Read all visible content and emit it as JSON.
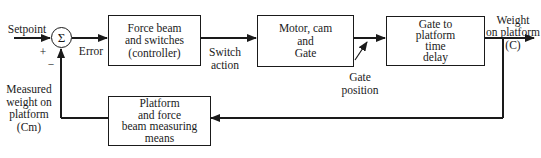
{
  "diagram": {
    "type": "block-diagram",
    "input": {
      "label": "Setpoint",
      "sign_plus": "+",
      "sign_minus": "−"
    },
    "summing_junction": {
      "symbol": "Σ"
    },
    "error_label": "Error",
    "blocks": [
      {
        "id": "controller",
        "label": "Force beam\nand switches\n(controller)"
      },
      {
        "id": "actuator",
        "label": "Motor, cam\nand\nGate"
      },
      {
        "id": "process",
        "label": "Gate to\nplatform\ntime\ndelay"
      },
      {
        "id": "sensor",
        "label": "Platform\nand force\nbeam measuring\nmeans"
      }
    ],
    "signals": {
      "switch_action": "Switch\naction",
      "gate_position": "Gate\nposition",
      "output": "Weight\non platform\n(C)",
      "measured": "Measured\nweight on\nplatform\n(Cm)"
    }
  }
}
